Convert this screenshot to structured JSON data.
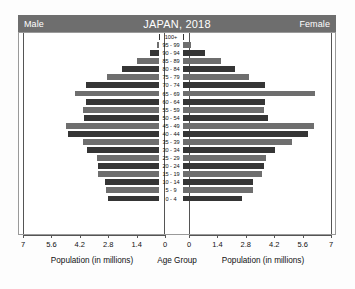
{
  "header": {
    "male_label": "Male",
    "title": "JAPAN, 2018",
    "female_label": "Female",
    "band_color": "#6e6e6e"
  },
  "axis": {
    "left_caption": "Population (in millions)",
    "center_caption": "Age Group",
    "right_caption": "Population (in millions)",
    "left_ticks": [
      "7",
      "5.6",
      "4.2",
      "2.8",
      "1.4",
      "0"
    ],
    "right_ticks": [
      "0",
      "1.4",
      "2.8",
      "4.2",
      "5.6",
      "7"
    ],
    "max": 7,
    "tick_step": 1.4
  },
  "colors": {
    "bar_dark": "#353535",
    "bar_medium": "#6e6e6e",
    "frame": "#9a9a9a",
    "background": "#ffffff"
  },
  "chart_data": {
    "type": "bar",
    "title": "JAPAN, 2018",
    "subtype": "population-pyramid",
    "xlabel": "Population (in millions)",
    "ylabel": "Age Group",
    "xlim": [
      0,
      7
    ],
    "grid": false,
    "legend": [
      "Male",
      "Female"
    ],
    "legend_position": "top-left-and-top-right",
    "categories": [
      "100+",
      "95 - 99",
      "90 - 94",
      "85 - 89",
      "80 - 84",
      "75 - 79",
      "70 - 74",
      "65 - 69",
      "60 - 64",
      "55 - 59",
      "50 - 54",
      "45 - 49",
      "40 - 44",
      "35 - 39",
      "30 - 34",
      "25 - 29",
      "20 - 24",
      "15 - 19",
      "10 - 14",
      "5 - 9",
      "0 - 4"
    ],
    "series": [
      {
        "name": "Male",
        "side": "left",
        "values": [
          0.01,
          0.11,
          0.47,
          1.08,
          1.87,
          2.6,
          3.65,
          4.2,
          3.65,
          3.82,
          3.75,
          4.65,
          4.53,
          3.78,
          3.58,
          3.1,
          3.05,
          3.05,
          2.72,
          2.67,
          2.55
        ]
      },
      {
        "name": "Female",
        "side": "right",
        "values": [
          0.07,
          0.38,
          1.12,
          1.9,
          2.58,
          3.3,
          4.1,
          6.6,
          4.1,
          4.05,
          4.25,
          6.55,
          6.25,
          5.45,
          4.6,
          4.15,
          4.05,
          3.95,
          3.5,
          3.48,
          2.95
        ]
      }
    ]
  }
}
